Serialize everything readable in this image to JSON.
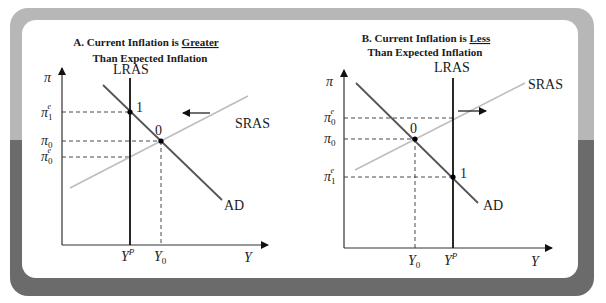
{
  "colors": {
    "frame_top": "#b7b7b7",
    "frame_bottom": "#6b6b6b",
    "panel": "#ffffff",
    "lras": "#111111",
    "ad": "#555555",
    "sras": "#bdbdbd"
  },
  "panels": [
    {
      "title_line1_prefix": "A. Current Inflation is ",
      "title_line1_emph": "Greater",
      "title_line2": "Than Expected Inflation",
      "y_axis_label": "π",
      "x_axis_label": "Y",
      "curves": {
        "lras": "LRAS",
        "sras": "SRAS",
        "ad": "AD"
      },
      "y_ticks": [
        {
          "base": "π",
          "sub": "1",
          "sup": "e"
        },
        {
          "base": "π",
          "sub": "0",
          "sup": ""
        },
        {
          "base": "π",
          "sub": "0",
          "sup": "e"
        }
      ],
      "x_ticks": [
        {
          "base": "Y",
          "sub": "",
          "sup": "P"
        },
        {
          "base": "Y",
          "sub": "0",
          "sup": ""
        }
      ],
      "points": [
        {
          "label": "1"
        },
        {
          "label": "0"
        }
      ],
      "shift_arrow": "left"
    },
    {
      "title_line1_prefix": "B. Current Inflation is ",
      "title_line1_emph": "Less",
      "title_line2": "Than Expected Inflation",
      "y_axis_label": "π",
      "x_axis_label": "Y",
      "curves": {
        "lras": "LRAS",
        "sras": "SRAS",
        "ad": "AD"
      },
      "y_ticks": [
        {
          "base": "π",
          "sub": "0",
          "sup": "e"
        },
        {
          "base": "π",
          "sub": "0",
          "sup": ""
        },
        {
          "base": "π",
          "sub": "1",
          "sup": "e"
        }
      ],
      "x_ticks": [
        {
          "base": "Y",
          "sub": "0",
          "sup": ""
        },
        {
          "base": "Y",
          "sub": "",
          "sup": "P"
        }
      ],
      "points": [
        {
          "label": "0"
        },
        {
          "label": "1"
        }
      ],
      "shift_arrow": "right"
    }
  ]
}
